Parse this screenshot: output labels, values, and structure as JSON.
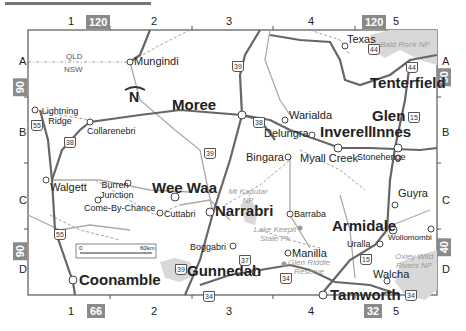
{
  "map": {
    "grid_columns": [
      "1",
      "2",
      "3",
      "4",
      "5"
    ],
    "grid_rows": [
      "A",
      "B",
      "C",
      "D"
    ],
    "adjacent_refs": {
      "top_left": "120",
      "top_right": "120",
      "left_top": "90",
      "left_bottom": "90",
      "right_top": "50",
      "right_bottom": "40",
      "bottom_left": "66",
      "bottom_right": "32"
    },
    "state_labels": {
      "north": "QLD",
      "south": "NSW"
    },
    "north_arrow": "N",
    "scale_bar": {
      "start": "0",
      "end": "60km"
    },
    "towns_major": [
      {
        "name": "Moree"
      },
      {
        "name": "Tenterfield"
      },
      {
        "name": "Glen Innes"
      },
      {
        "name": "Inverell"
      },
      {
        "name": "Wee Waa"
      },
      {
        "name": "Narrabri"
      },
      {
        "name": "Armidale"
      },
      {
        "name": "Gunnedah"
      },
      {
        "name": "Coonamble"
      },
      {
        "name": "Tamworth"
      }
    ],
    "towns_minor": [
      {
        "name": "Mungindi"
      },
      {
        "name": "Texas"
      },
      {
        "name": "Lightning Ridge"
      },
      {
        "name": "Collarenebri"
      },
      {
        "name": "Warialda"
      },
      {
        "name": "Delungra"
      },
      {
        "name": "Bingara"
      },
      {
        "name": "Myall Creek"
      },
      {
        "name": "Stonehenge"
      },
      {
        "name": "Walgett"
      },
      {
        "name": "Burren Junction"
      },
      {
        "name": "Come-By-Chance"
      },
      {
        "name": "Cuttabri"
      },
      {
        "name": "Guyra"
      },
      {
        "name": "Barraba"
      },
      {
        "name": "Boggabri"
      },
      {
        "name": "Manilla"
      },
      {
        "name": "Uralla"
      },
      {
        "name": "Wollomombi"
      },
      {
        "name": "Walcha"
      }
    ],
    "parks": [
      {
        "name": "Bald Rock NP"
      },
      {
        "name": "Mt Kaputar NP"
      },
      {
        "name": "Lake Keepit State Pk"
      },
      {
        "name": "Glen Riddle Reserve"
      },
      {
        "name": "Oxley Wild Rivers NP"
      }
    ],
    "highways": [
      "44",
      "44",
      "39",
      "39",
      "39",
      "38",
      "38",
      "55",
      "55",
      "15",
      "15",
      "37",
      "34",
      "34",
      "34",
      "34"
    ]
  }
}
